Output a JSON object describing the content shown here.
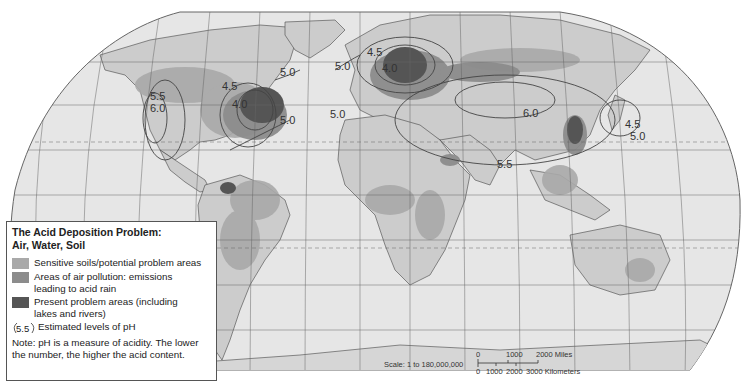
{
  "legend": {
    "title_line1": "The Acid Deposition Problem:",
    "title_line2": "Air, Water, Soil",
    "items": [
      {
        "label_line1": "Sensitive soils/potential problem areas",
        "label_line2": "",
        "color": "#a9a9a9"
      },
      {
        "label_line1": "Areas of air pollution: emissions",
        "label_line2": "leading to acid rain",
        "color": "#8c8c8c"
      },
      {
        "label_line1": "Present problem areas (including",
        "label_line2": "lakes and rivers)",
        "color": "#555555"
      }
    ],
    "ph_symbol": "5.5",
    "ph_label": "Estimated levels of pH",
    "note_line1": "Note: pH is a measure of acidity. The lower",
    "note_line2": "the number, the higher the acid content."
  },
  "scale": {
    "text": "Scale: 1 to 180,000,000",
    "miles_ticks": [
      "0",
      "1000",
      "2000 Miles"
    ],
    "km_ticks": [
      "0",
      "1000",
      "2000",
      "3000 Kilometers"
    ]
  },
  "ph_labels": [
    {
      "text": "5.0",
      "region": "north-america-northeast"
    },
    {
      "text": "4.5",
      "region": "north-america-great-lakes"
    },
    {
      "text": "4.0",
      "region": "north-america-ohio-valley"
    },
    {
      "text": "5.0",
      "region": "north-america-atlantic"
    },
    {
      "text": "5.5",
      "region": "north-america-west"
    },
    {
      "text": "6.0",
      "region": "north-america-west"
    },
    {
      "text": "5.0",
      "region": "europe-north-atlantic"
    },
    {
      "text": "4.5",
      "region": "europe-scandinavia"
    },
    {
      "text": "4.0",
      "region": "europe-central"
    },
    {
      "text": "5.0",
      "region": "europe-iberia"
    },
    {
      "text": "6.0",
      "region": "central-asia"
    },
    {
      "text": "5.5",
      "region": "south-asia"
    },
    {
      "text": "4.5",
      "region": "japan"
    },
    {
      "text": "5.0",
      "region": "japan"
    }
  ],
  "colors": {
    "ocean": "#e6e6e6",
    "land": "#cccccc",
    "sensitive": "#a9a9a9",
    "pollution": "#8c8c8c",
    "present": "#555555",
    "grid": "#555555"
  }
}
